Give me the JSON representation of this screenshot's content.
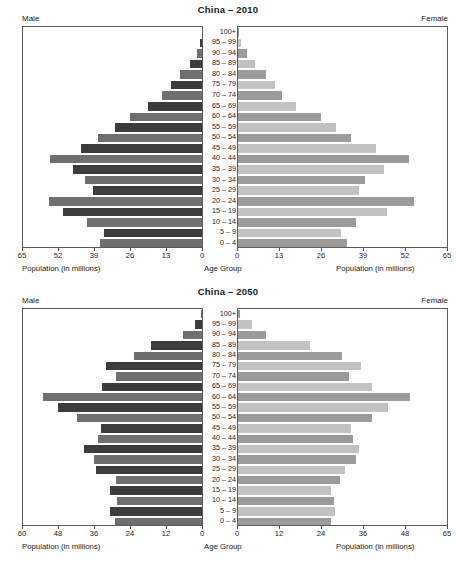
{
  "figure": {
    "male_label": "Male",
    "female_label": "Female",
    "center_axis_caption": "Age Group",
    "population_caption": "Population (in millions)"
  },
  "chart_data": [
    {
      "type": "bar",
      "title": "China – 2010",
      "orientation": "horizontal-pyramid",
      "xlabel": "Population (in millions)",
      "ylabel": "Age Group",
      "center_label": "Age Group",
      "grid": false,
      "legend": "none",
      "left_side": "Male",
      "right_side": "Female",
      "left_ticks": [
        65,
        52,
        39,
        26,
        13,
        0
      ],
      "right_ticks": [
        0,
        13,
        26,
        39,
        52,
        65
      ],
      "xlim_left": [
        0,
        65
      ],
      "xlim_right": [
        0,
        65
      ],
      "categories": [
        "100+",
        "95 – 99",
        "90 – 94",
        "85 – 89",
        "80 – 84",
        "75 – 79",
        "70 – 74",
        "65 – 69",
        "60 – 64",
        "55 – 59",
        "50 – 54",
        "45 – 49",
        "40 – 44",
        "35 – 39",
        "30 – 34",
        "25 – 29",
        "20 – 24",
        "15 – 19",
        "10 – 14",
        "5 – 9",
        "0 – 4"
      ],
      "series": [
        {
          "name": "Male",
          "values": [
            0.1,
            0.6,
            1.9,
            4.2,
            7.9,
            11.3,
            14.6,
            19.6,
            26.0,
            31.6,
            37.8,
            44.0,
            55.1,
            47.0,
            42.4,
            39.5,
            55.6,
            50.3,
            41.9,
            35.5,
            37.2
          ]
        },
        {
          "name": "Female",
          "values": [
            0.2,
            1.0,
            2.8,
            5.3,
            8.7,
            11.5,
            13.8,
            18.1,
            25.8,
            30.5,
            35.2,
            42.9,
            53.1,
            45.3,
            39.5,
            37.5,
            54.8,
            46.3,
            36.8,
            32.1,
            34.0
          ]
        }
      ]
    },
    {
      "type": "bar",
      "title": "China – 2050",
      "orientation": "horizontal-pyramid",
      "xlabel": "Population (in millions)",
      "ylabel": "Age Group",
      "center_label": "Age Group",
      "grid": false,
      "legend": "none",
      "left_side": "Male",
      "right_side": "Female",
      "left_ticks": [
        60,
        48,
        36,
        24,
        12,
        0
      ],
      "right_ticks": [
        0,
        12,
        24,
        36,
        48,
        65
      ],
      "xlim_left": [
        0,
        60
      ],
      "xlim_right": [
        0,
        65
      ],
      "categories": [
        "100+",
        "95 – 99",
        "90 – 94",
        "85 – 89",
        "80 – 84",
        "75 – 79",
        "70 – 74",
        "65 – 69",
        "60 – 64",
        "55 – 59",
        "50 – 54",
        "45 – 49",
        "40 – 44",
        "35 – 39",
        "30 – 34",
        "25 – 29",
        "20 – 24",
        "15 – 19",
        "10 – 14",
        "5 – 9",
        "0 – 4"
      ],
      "series": [
        {
          "name": "Male",
          "values": [
            0.4,
            2.4,
            6.3,
            17.1,
            22.8,
            32.3,
            28.8,
            33.4,
            53.3,
            48.2,
            41.8,
            33.8,
            35.0,
            39.5,
            36.3,
            35.5,
            28.7,
            31.0,
            28.5,
            31.0,
            29.0
          ]
        },
        {
          "name": "Female",
          "values": [
            0.6,
            4.2,
            8.6,
            22.5,
            32.4,
            38.1,
            34.4,
            41.7,
            53.4,
            46.6,
            41.6,
            35.0,
            35.9,
            37.7,
            36.6,
            33.2,
            31.8,
            28.9,
            30.0,
            30.1,
            28.9
          ]
        }
      ]
    }
  ]
}
